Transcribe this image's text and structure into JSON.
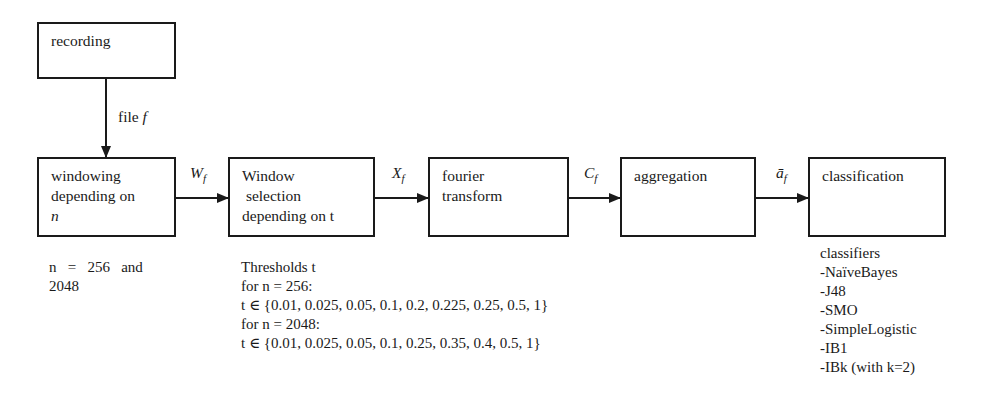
{
  "diagram": {
    "nodes": [
      {
        "id": "recording",
        "lines": [
          "recording"
        ]
      },
      {
        "id": "windowing",
        "lines": [
          "windowing",
          "depending on",
          "n"
        ]
      },
      {
        "id": "window_selection",
        "lines": [
          "Window",
          " selection",
          "depending on t"
        ]
      },
      {
        "id": "fourier",
        "lines": [
          "fourier",
          "transform"
        ]
      },
      {
        "id": "aggregation",
        "lines": [
          "aggregation"
        ]
      },
      {
        "id": "classification",
        "lines": [
          "classification"
        ]
      }
    ],
    "edges": [
      {
        "from": "recording",
        "to": "windowing",
        "label_main": "file ",
        "label_var": "f"
      },
      {
        "from": "windowing",
        "to": "window_selection",
        "label_main": "W",
        "label_sub": "f"
      },
      {
        "from": "window_selection",
        "to": "fourier",
        "label_main": "X",
        "label_sub": "f"
      },
      {
        "from": "fourier",
        "to": "aggregation",
        "label_main": "C",
        "label_sub": "f"
      },
      {
        "from": "aggregation",
        "to": "classification",
        "label_main": "ā",
        "label_sub": "f"
      }
    ]
  },
  "notes": {
    "windowing": {
      "line1": "n   =   256   and",
      "line2": "2048"
    },
    "thresholds": {
      "title": "Thresholds t",
      "n256_label": "for n = 256:",
      "n256_set": "t ∈ {0.01, 0.025, 0.05, 0.1, 0.2, 0.225, 0.25, 0.5, 1}",
      "n2048_label": "for n = 2048:",
      "n2048_set": "t ∈ {0.01, 0.025, 0.05, 0.1, 0.25, 0.35, 0.4, 0.5, 1}"
    },
    "classifiers": {
      "title": "classifiers",
      "items": [
        "-NaïveBayes",
        "-J48",
        "-SMO",
        "-SimpleLogistic",
        "-IB1",
        "-IBk (with k=2)"
      ]
    }
  }
}
